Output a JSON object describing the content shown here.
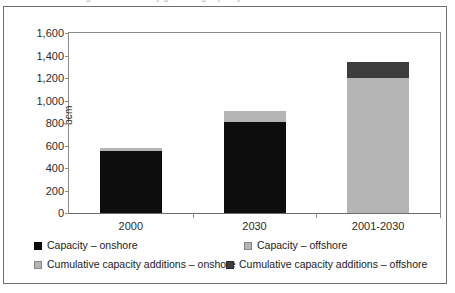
{
  "figure": {
    "clipped_title": "World gas-fired electricity generating capacity"
  },
  "chart_data": {
    "type": "bar",
    "stacked": true,
    "title": "",
    "xlabel": "",
    "ylabel": "bcm",
    "ylim": [
      0,
      1600
    ],
    "ytick_step": 200,
    "grid": false,
    "legend_position": "bottom",
    "categories": [
      "2000",
      "2030",
      "2001-2030"
    ],
    "ytick_labels": [
      "0",
      "200",
      "400",
      "600",
      "800",
      "1,000",
      "1,200",
      "1,400",
      "1,600"
    ],
    "ytick_values": [
      0,
      200,
      400,
      600,
      800,
      1000,
      1200,
      1400,
      1600
    ],
    "series": [
      {
        "name": "Capacity – onshore",
        "color": "#0d0d0d",
        "values": [
          550,
          810,
          0
        ]
      },
      {
        "name": "Capacity – offshore",
        "color": "#b5b5b5",
        "values": [
          30,
          100,
          0
        ]
      },
      {
        "name": "Cumulative capacity additions – onshore",
        "color": "#b5b5b5",
        "values": [
          0,
          0,
          1200
        ]
      },
      {
        "name": "Cumulative capacity additions – offshore",
        "color": "#3d3d3d",
        "values": [
          0,
          0,
          145
        ]
      }
    ],
    "totals": [
      580,
      910,
      1345
    ],
    "bars": [
      {
        "category": "2000",
        "segments": [
          {
            "series": "Capacity – onshore",
            "value": 550,
            "color": "#0d0d0d"
          },
          {
            "series": "Capacity – offshore",
            "value": 30,
            "color": "#b5b5b5"
          }
        ]
      },
      {
        "category": "2030",
        "segments": [
          {
            "series": "Capacity – onshore",
            "value": 810,
            "color": "#0d0d0d"
          },
          {
            "series": "Capacity – offshore",
            "value": 100,
            "color": "#b5b5b5"
          }
        ]
      },
      {
        "category": "2001-2030",
        "segments": [
          {
            "series": "Cumulative capacity additions – onshore",
            "value": 1200,
            "color": "#b5b5b5"
          },
          {
            "series": "Cumulative capacity additions – offshore",
            "value": 145,
            "color": "#3d3d3d"
          }
        ]
      }
    ]
  },
  "legend": {
    "rows": [
      [
        {
          "label": "Capacity – onshore",
          "color": "#0d0d0d"
        },
        {
          "label": "Capacity – offshore",
          "color": "#b5b5b5"
        }
      ],
      [
        {
          "label": "Cumulative capacity additions – onshore",
          "color": "#b5b5b5"
        },
        {
          "label": "Cumulative capacity additions – offshore",
          "color": "#3d3d3d"
        }
      ]
    ]
  },
  "colors": {
    "onshore_capacity": "#0d0d0d",
    "offshore_capacity": "#b5b5b5",
    "cumulative_onshore": "#b5b5b5",
    "cumulative_offshore": "#3d3d3d",
    "frame": "#6e6e6e",
    "axis": "#8a8a8a",
    "text": "#1a1a1a",
    "background": "#ffffff"
  }
}
